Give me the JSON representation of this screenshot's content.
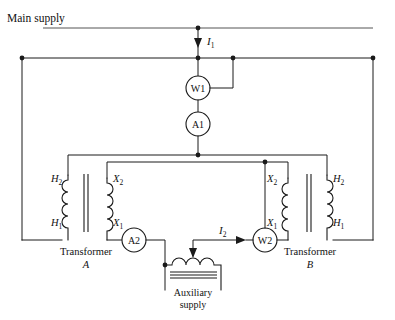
{
  "figure": {
    "title": "Main supply"
  },
  "currents": {
    "primary": "I",
    "primary_sub": "1",
    "secondary": "I",
    "secondary_sub": "2"
  },
  "meters": [
    {
      "id": "w1",
      "label": "W1",
      "type": "wattmeter"
    },
    {
      "id": "a1",
      "label": "A1",
      "type": "ammeter"
    },
    {
      "id": "a2",
      "label": "A2",
      "type": "ammeter"
    },
    {
      "id": "w2",
      "label": "W2",
      "type": "wattmeter"
    }
  ],
  "transformers": [
    {
      "id": "a",
      "name": "Transformer",
      "designation": "A",
      "primary_terminals": [
        {
          "letter": "H",
          "sub": "2"
        },
        {
          "letter": "H",
          "sub": "1"
        }
      ],
      "secondary_terminals": [
        {
          "letter": "X",
          "sub": "2"
        },
        {
          "letter": "X",
          "sub": "1"
        }
      ]
    },
    {
      "id": "b",
      "name": "Transformer",
      "designation": "B",
      "primary_terminals": [
        {
          "letter": "H",
          "sub": "2"
        },
        {
          "letter": "H",
          "sub": "1"
        }
      ],
      "secondary_terminals": [
        {
          "letter": "X",
          "sub": "2"
        },
        {
          "letter": "X",
          "sub": "1"
        }
      ]
    }
  ],
  "auxiliary": {
    "line1": "Auxiliary",
    "line2": "supply"
  },
  "colors": {
    "wire": "#1a1a1a",
    "text": "#111111",
    "background": "#ffffff"
  }
}
